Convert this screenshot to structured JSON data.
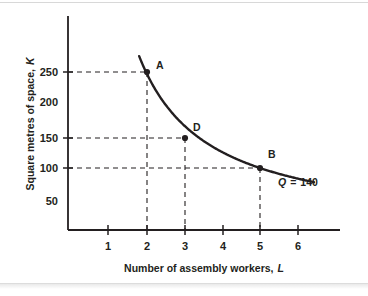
{
  "figure": {
    "background_color": "#ffffff",
    "ink_color": "#231f20"
  },
  "chart_data": {
    "type": "line",
    "title": "",
    "subtitle": "",
    "xlabel": "Number of assembly workers, L",
    "ylabel": "Square metres of space, K",
    "xlabel_plain": "Number of assembly workers,",
    "xlabel_italic": "L",
    "ylabel_plain": "Square metres of space,",
    "ylabel_italic": "K",
    "xlim": [
      0,
      6.9
    ],
    "ylim": [
      0,
      310
    ],
    "xticks": [
      1,
      2,
      3,
      4,
      5,
      6
    ],
    "xtick_labels": [
      "1",
      "2",
      "3",
      "4",
      "5",
      "6"
    ],
    "yticks": [
      50,
      100,
      150,
      200,
      250
    ],
    "ytick_labels": [
      "50",
      "100",
      "150",
      "200",
      "250"
    ],
    "yticks_with_marks": [
      100,
      150,
      250
    ],
    "grid": false,
    "legend": "none",
    "series": [
      {
        "name": "Isoquant Q = 140",
        "curve_type": "isoquant",
        "relation": "K = 500 / L",
        "x": [
          1.82,
          2.0,
          2.2,
          2.5,
          3.0,
          3.5,
          4.0,
          4.5,
          5.0,
          5.5,
          6.0,
          6.4
        ],
        "y": [
          275,
          250,
          227,
          200,
          150,
          143,
          125,
          111,
          100,
          91,
          83,
          78
        ],
        "color": "#231f20",
        "width_px": 2.4
      }
    ],
    "points": [
      {
        "label": "A",
        "x": 2,
        "y": 250,
        "label_dx": 8,
        "label_dy": -5
      },
      {
        "label": "D",
        "x": 3,
        "y": 150,
        "label_dx": 7,
        "label_dy": -6
      },
      {
        "label": "B",
        "x": 5,
        "y": 100,
        "label_dx": 7,
        "label_dy": -8
      }
    ],
    "guide_lines": [
      {
        "for": "A",
        "horizontal_y": 250,
        "vertical_x": 2
      },
      {
        "for": "D",
        "horizontal_y": 150,
        "vertical_x": 3
      },
      {
        "for": "B",
        "horizontal_y": 100,
        "vertical_x": 5
      }
    ],
    "annotations": [
      {
        "name": "isoquant-label",
        "text": "Q = 140",
        "symbol": "Q",
        "equals": "=",
        "value": "140",
        "x": 5.9,
        "y": 62
      }
    ]
  }
}
